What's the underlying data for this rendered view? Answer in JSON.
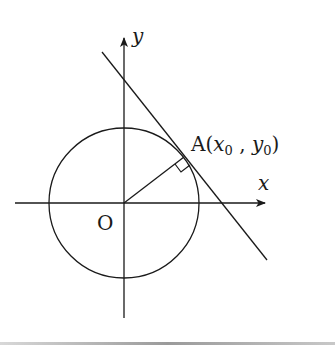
{
  "diagram": {
    "labels": {
      "y_axis": "y",
      "x_axis": "x",
      "origin": "O",
      "point_prefix": "A(",
      "x0": "x",
      "x0_sub": "0",
      "sep": " , ",
      "y0": "y",
      "y0_sub": "0",
      "point_suffix": ")"
    },
    "colors": {
      "stroke": "#1a1a1a",
      "background": "#ffffff"
    },
    "elements": [
      "x-axis",
      "y-axis",
      "circle centered at O",
      "radius OA",
      "tangent line through A",
      "right-angle marker at A"
    ]
  }
}
